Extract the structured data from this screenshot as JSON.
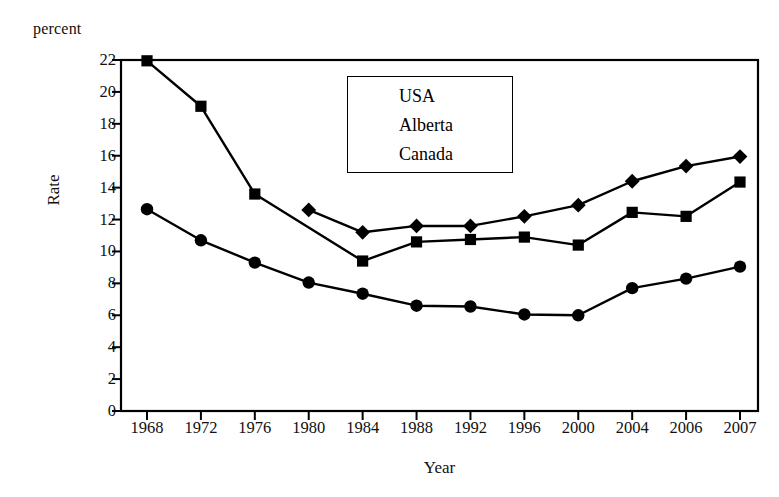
{
  "chart_data": {
    "type": "line",
    "title": "",
    "unit_label": "percent",
    "xlabel": "Year",
    "ylabel": "Rate",
    "categories": [
      "1968",
      "1972",
      "1976",
      "1980",
      "1984",
      "1988",
      "1992",
      "1996",
      "2000",
      "2004",
      "2006",
      "2007"
    ],
    "ylim": [
      0,
      22
    ],
    "yticks": [
      0,
      2,
      4,
      6,
      8,
      10,
      12,
      14,
      16,
      18,
      20,
      22
    ],
    "ytick_labels": [
      "0",
      "2",
      "4",
      "6",
      "8",
      "10",
      "12",
      "14",
      "16",
      "18",
      "20",
      "22"
    ],
    "grid": false,
    "legend_position": "upper-center",
    "series": [
      {
        "name": "USA",
        "marker": "diamond",
        "values": [
          null,
          null,
          null,
          12.6,
          11.2,
          11.6,
          11.6,
          12.2,
          12.9,
          14.4,
          15.35,
          15.95
        ]
      },
      {
        "name": "Alberta",
        "marker": "square",
        "values": [
          21.95,
          19.1,
          13.6,
          null,
          9.4,
          10.6,
          10.75,
          10.9,
          10.4,
          12.45,
          12.2,
          14.35
        ]
      },
      {
        "name": "Canada",
        "marker": "circle",
        "values": [
          12.65,
          10.7,
          9.3,
          8.05,
          7.35,
          6.6,
          6.55,
          6.05,
          6.0,
          7.7,
          8.3,
          9.05
        ]
      }
    ]
  },
  "legend": {
    "items": [
      {
        "label": "USA",
        "marker": "diamond"
      },
      {
        "label": "Alberta",
        "marker": "square"
      },
      {
        "label": "Canada",
        "marker": "circle"
      }
    ]
  },
  "colors": {
    "ink": "#000000",
    "background": "#ffffff"
  }
}
